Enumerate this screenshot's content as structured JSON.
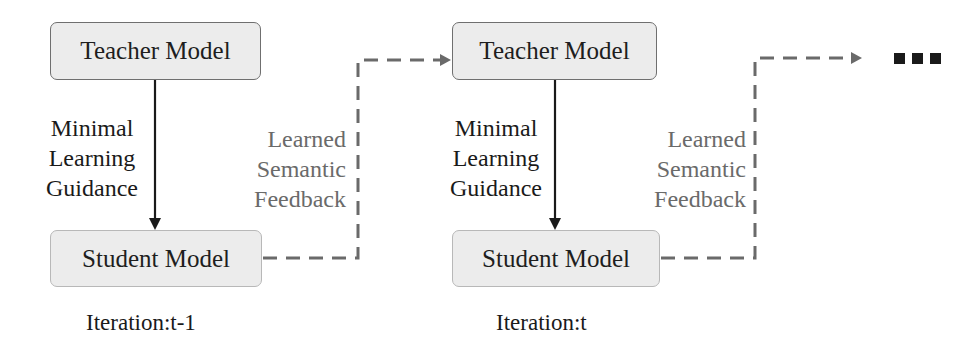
{
  "diagram": {
    "iterations": [
      {
        "teacher_label": "Teacher Model",
        "student_label": "Student Model",
        "guidance_lines": [
          "Minimal",
          "Learning",
          "Guidance"
        ],
        "feedback_lines": [
          "Learned",
          "Semantic",
          "Feedback"
        ],
        "iteration_label": "Iteration:t-1"
      },
      {
        "teacher_label": "Teacher Model",
        "student_label": "Student Model",
        "guidance_lines": [
          "Minimal",
          "Learning",
          "Guidance"
        ],
        "feedback_lines": [
          "Learned",
          "Semantic",
          "Feedback"
        ],
        "iteration_label": "Iteration:t"
      }
    ],
    "continuation_icon": "ellipsis-squares-icon",
    "colors": {
      "box_fill": "#ececec",
      "teacher_border": "#6f6f6f",
      "student_border": "#b8b8b8",
      "solid_arrow": "#1a1a1a",
      "dashed_arrow": "#6a6a6a",
      "feedback_text": "#6a6a6a"
    }
  }
}
